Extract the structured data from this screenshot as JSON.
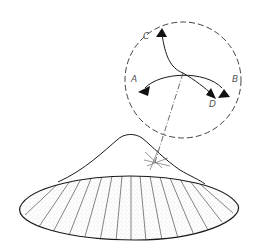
{
  "diagram": {
    "labels": {
      "a": "A",
      "b": "B",
      "c": "C",
      "d": "D"
    },
    "colors": {
      "line": "#1a1a1a",
      "dashed": "#444444",
      "label": "#555555",
      "stipple": "#888888",
      "background": "#ffffff"
    }
  }
}
